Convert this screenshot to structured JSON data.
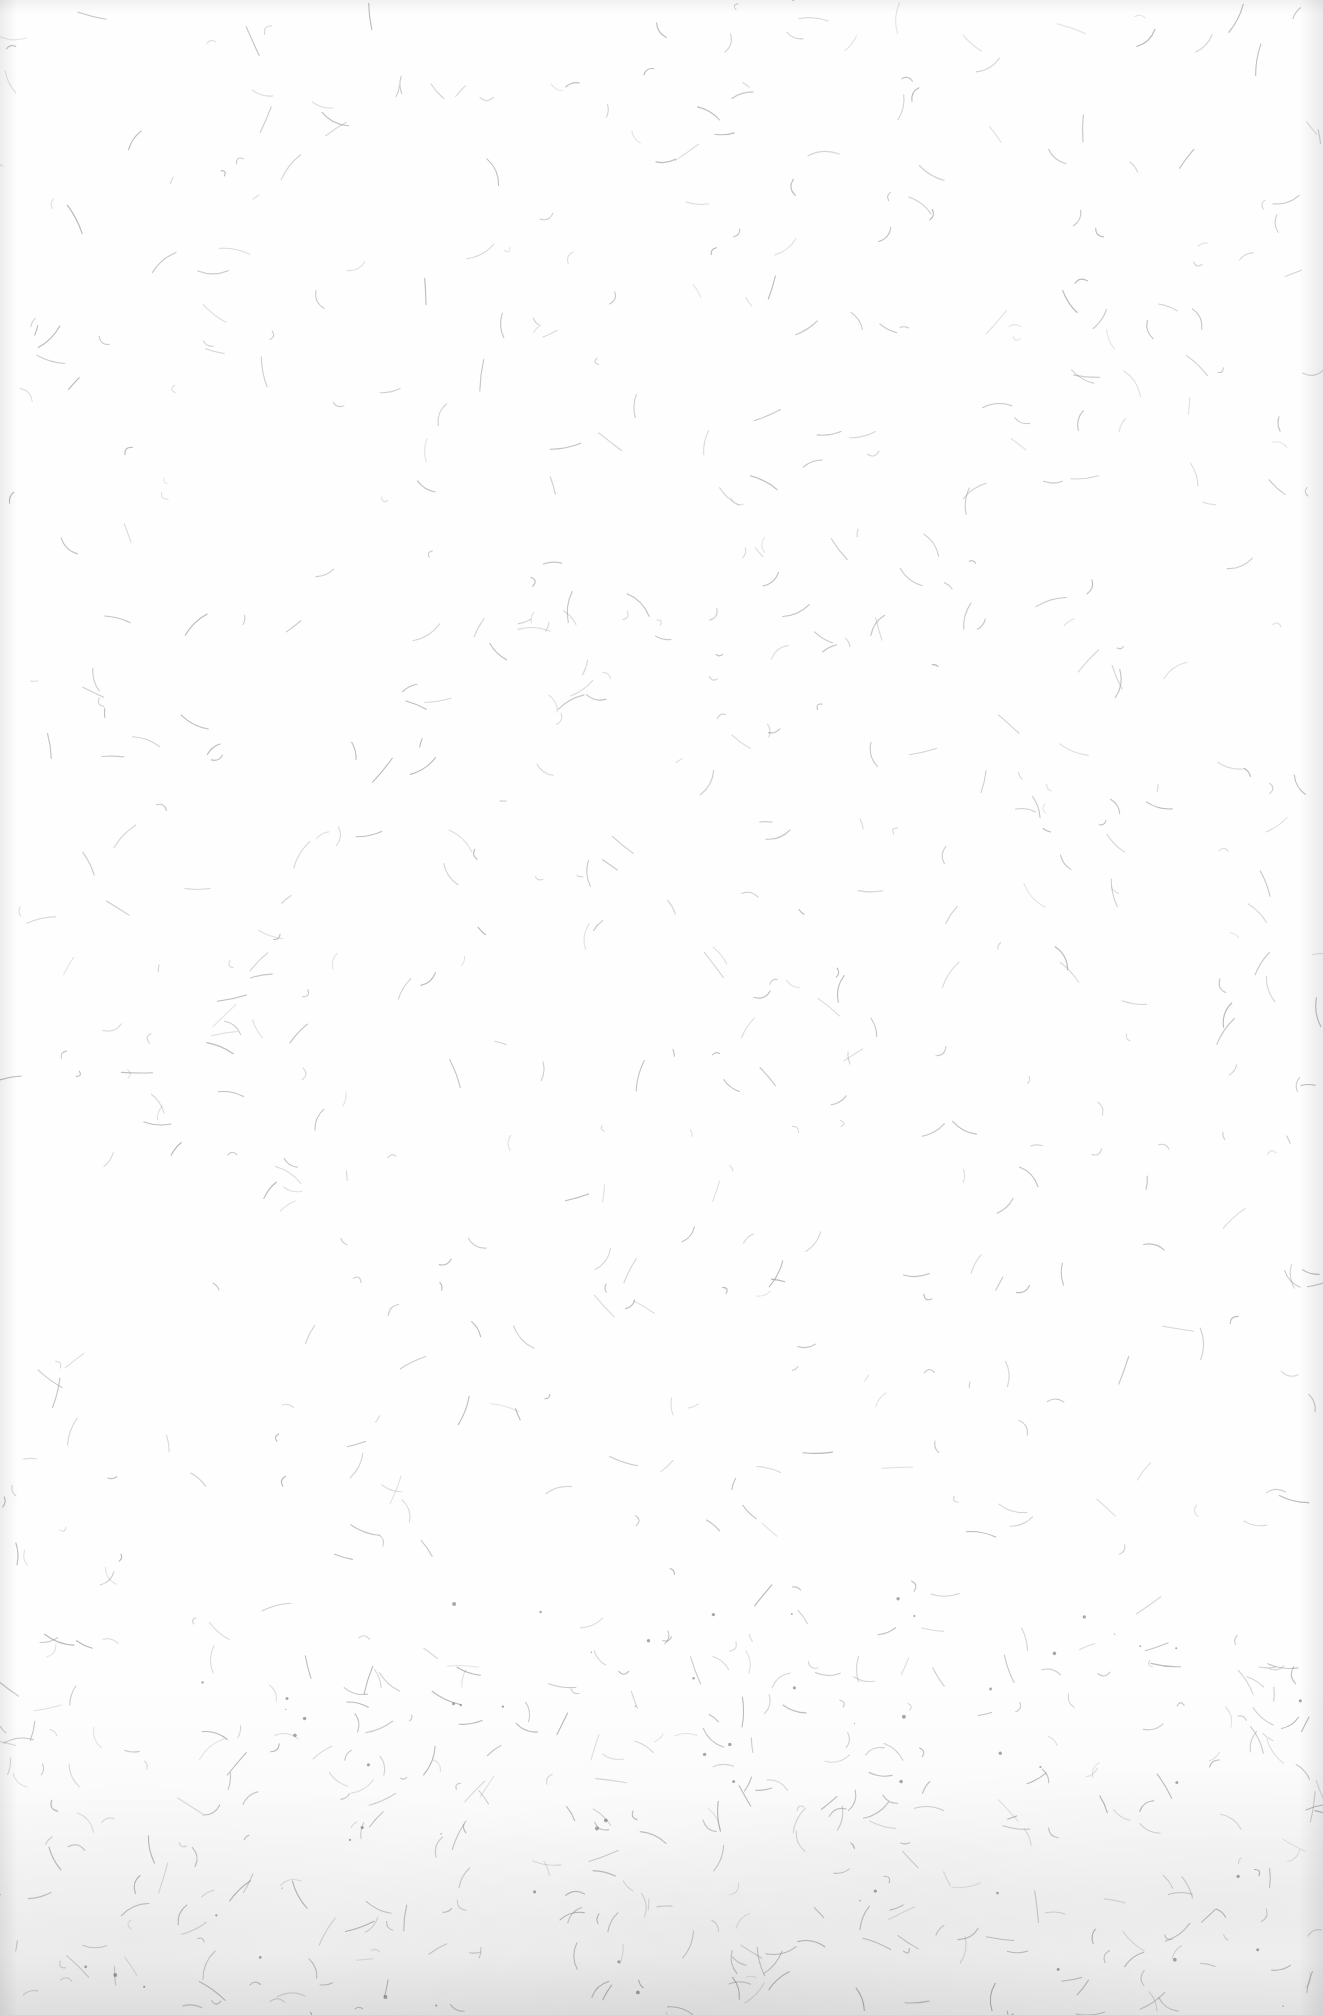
{
  "document": {
    "type": "blank scanned page",
    "text": "",
    "paper_color": "#fefefe",
    "fiber_color": "#9a9a9a"
  }
}
